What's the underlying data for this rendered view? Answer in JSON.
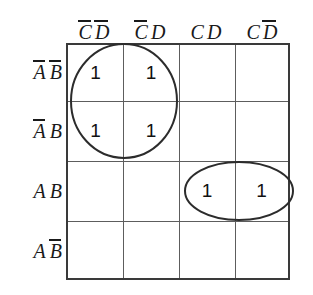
{
  "diagram": {
    "type": "karnaugh-map",
    "variables": [
      "A",
      "B",
      "C",
      "D"
    ],
    "rows": 4,
    "columns": 4
  },
  "column_headers": [
    {
      "id": "col-0",
      "text": "C̅ D̅",
      "literals": [
        {
          "symbol": "C",
          "negated": true
        },
        {
          "symbol": "D",
          "negated": true
        }
      ]
    },
    {
      "id": "col-1",
      "text": "C̅ D",
      "literals": [
        {
          "symbol": "C",
          "negated": true
        },
        {
          "symbol": "D",
          "negated": false
        }
      ]
    },
    {
      "id": "col-2",
      "text": "C D",
      "literals": [
        {
          "symbol": "C",
          "negated": false
        },
        {
          "symbol": "D",
          "negated": false
        }
      ]
    },
    {
      "id": "col-3",
      "text": "C D̅",
      "literals": [
        {
          "symbol": "C",
          "negated": false
        },
        {
          "symbol": "D",
          "negated": true
        }
      ]
    }
  ],
  "row_headers": [
    {
      "id": "row-0",
      "text": "A̅ B̅",
      "literals": [
        {
          "symbol": "A",
          "negated": true
        },
        {
          "symbol": "B",
          "negated": true
        }
      ]
    },
    {
      "id": "row-1",
      "text": "A̅ B",
      "literals": [
        {
          "symbol": "A",
          "negated": true
        },
        {
          "symbol": "B",
          "negated": false
        }
      ]
    },
    {
      "id": "row-2",
      "text": "A B",
      "literals": [
        {
          "symbol": "A",
          "negated": false
        },
        {
          "symbol": "B",
          "negated": false
        }
      ]
    },
    {
      "id": "row-3",
      "text": "A B̅",
      "literals": [
        {
          "symbol": "A",
          "negated": false
        },
        {
          "symbol": "B",
          "negated": true
        }
      ]
    }
  ],
  "cells": [
    [
      "1",
      "1",
      "",
      ""
    ],
    [
      "1",
      "1",
      "",
      ""
    ],
    [
      "",
      "",
      "1",
      "1"
    ],
    [
      "",
      "",
      "",
      ""
    ]
  ],
  "groups": [
    {
      "id": "group-left",
      "shape": "ellipse",
      "cells": [
        [
          0,
          0
        ],
        [
          0,
          1
        ],
        [
          1,
          0
        ],
        [
          1,
          1
        ]
      ],
      "color": "#2c2c2c"
    },
    {
      "id": "group-right",
      "shape": "ellipse",
      "cells": [
        [
          2,
          2
        ],
        [
          2,
          3
        ]
      ],
      "color": "#2c2c2c"
    }
  ],
  "colors": {
    "background": "#ffffff",
    "border": "#3a3a3a",
    "gridline": "#5d5d5d",
    "text": "#1a1a1a",
    "group_stroke": "#2c2c2c"
  }
}
